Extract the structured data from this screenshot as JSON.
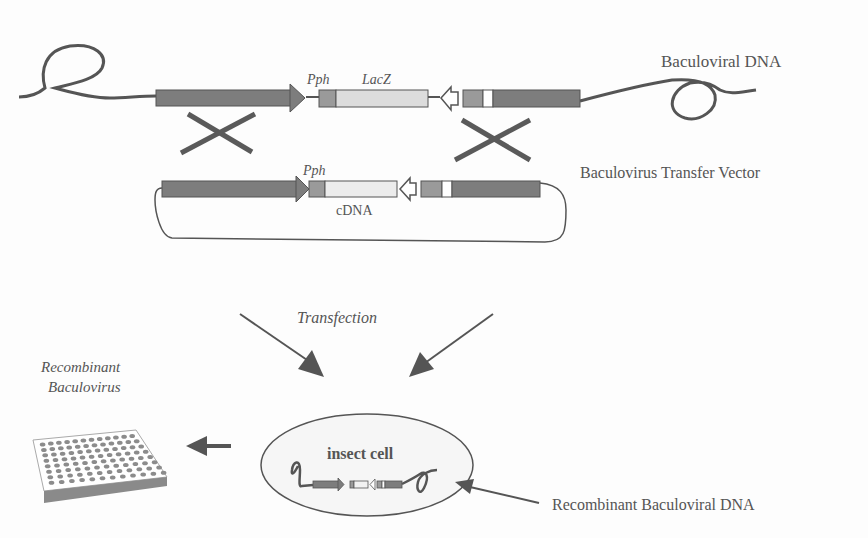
{
  "labels": {
    "baculoviral_dna": "Baculoviral DNA",
    "pph_top": "Pph",
    "lacz": "LacZ",
    "transfer_vector": "Baculovirus Transfer Vector",
    "pph_vector": "Pph",
    "cdna": "cDNA",
    "transfection": "Transfection",
    "insect_cell": "insect cell",
    "recombinant_baculovirus_line1": "Recombinant",
    "recombinant_baculovirus_line2": "Baculovirus",
    "recombinant_baculoviral_dna": "Recombinant Baculoviral DNA"
  },
  "colors": {
    "dark_gene": "#7d7d7d",
    "mid_gene": "#9a9a9a",
    "light_gene": "#dcdcdc",
    "line": "#555555",
    "cross": "#5a5a5a"
  }
}
